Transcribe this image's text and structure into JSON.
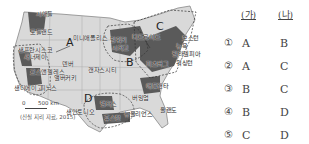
{
  "map": {
    "regions": [
      "A",
      "B",
      "C",
      "D"
    ],
    "cities": [
      {
        "name": "시애틀",
        "x": 34,
        "y": 14
      },
      {
        "name": "포틀랜드",
        "x": 30,
        "y": 28
      },
      {
        "name": "샌프란시스코",
        "x": 20,
        "y": 50
      },
      {
        "name": "새너제이",
        "x": 22,
        "y": 58
      },
      {
        "name": "로스앤젤레스",
        "x": 32,
        "y": 72
      },
      {
        "name": "샌디에이고",
        "x": 15,
        "y": 86
      },
      {
        "name": "피닉스",
        "x": 52,
        "y": 86
      },
      {
        "name": "앨버커키",
        "x": 62,
        "y": 76
      },
      {
        "name": "덴버",
        "x": 65,
        "y": 60
      },
      {
        "name": "미니애폴리스",
        "x": 73,
        "y": 34
      },
      {
        "name": "밀워키",
        "x": 120,
        "y": 35
      },
      {
        "name": "시카고",
        "x": 117,
        "y": 43
      },
      {
        "name": "디트로이트",
        "x": 135,
        "y": 34
      },
      {
        "name": "캔자스시티",
        "x": 88,
        "y": 66
      },
      {
        "name": "보스턴",
        "x": 184,
        "y": 36
      },
      {
        "name": "뉴욕",
        "x": 178,
        "y": 44
      },
      {
        "name": "필라델피아",
        "x": 181,
        "y": 52
      },
      {
        "name": "워싱턴",
        "x": 170,
        "y": 60
      },
      {
        "name": "피츠버그",
        "x": 146,
        "y": 60
      },
      {
        "name": "애틀랜타",
        "x": 145,
        "y": 86
      },
      {
        "name": "버밍엄",
        "x": 134,
        "y": 96
      },
      {
        "name": "댈러스",
        "x": 102,
        "y": 104
      },
      {
        "name": "샌안토니오",
        "x": 67,
        "y": 113
      },
      {
        "name": "휴스턴",
        "x": 103,
        "y": 118
      },
      {
        "name": "뉴올리언스",
        "x": 128,
        "y": 114
      },
      {
        "name": "올랜도",
        "x": 160,
        "y": 110
      }
    ],
    "scale_zero": "0",
    "scale_label": "500 km",
    "source": "(신실 지리 자료, 2015)"
  },
  "answers": {
    "header_ga": "(가)",
    "header_na": "(나)",
    "rows": [
      {
        "num": "①",
        "ga": "A",
        "na": "B"
      },
      {
        "num": "②",
        "ga": "A",
        "na": "C"
      },
      {
        "num": "③",
        "ga": "B",
        "na": "C"
      },
      {
        "num": "④",
        "ga": "B",
        "na": "D"
      },
      {
        "num": "⑤",
        "ga": "C",
        "na": "D"
      }
    ]
  }
}
